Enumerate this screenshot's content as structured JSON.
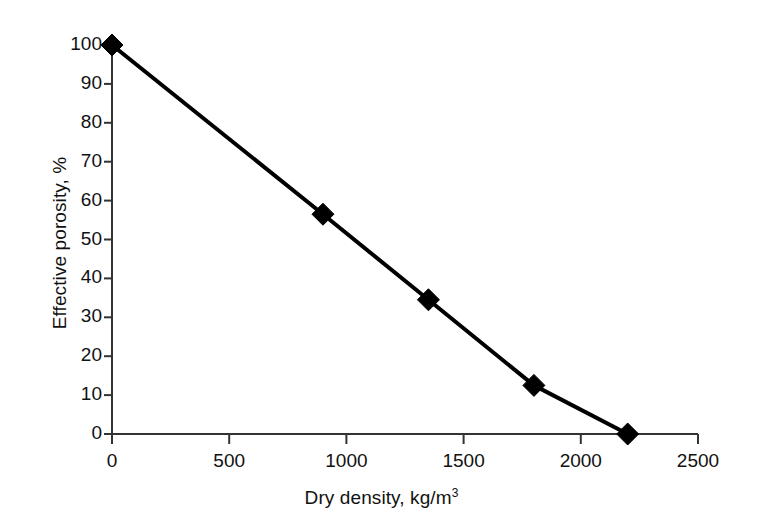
{
  "chart_data": {
    "type": "line",
    "title": "",
    "xlabel": "Dry density, kg/m",
    "xlabel_sup": "3",
    "ylabel": "Effective porosity, %",
    "xlim": [
      0,
      2500
    ],
    "ylim": [
      0,
      100
    ],
    "grid": false,
    "legend": "none",
    "marker": "filled-diamond",
    "line_color": "#000000",
    "marker_color": "#000000",
    "axis_color": "#333333",
    "x_ticks": [
      0,
      500,
      1000,
      1500,
      2000,
      2500
    ],
    "x_tick_labels": [
      "0",
      "500",
      "1000",
      "1500",
      "2000",
      "2500"
    ],
    "y_ticks": [
      0,
      10,
      20,
      30,
      40,
      50,
      60,
      70,
      80,
      90,
      100
    ],
    "y_tick_labels": [
      "0",
      "10",
      "20",
      "30",
      "40",
      "50",
      "60",
      "70",
      "80",
      "90",
      "100"
    ],
    "series": [
      {
        "name": "Effective porosity vs dry density",
        "x": [
          0,
          900,
          1350,
          1800,
          2200
        ],
        "y": [
          100,
          56.5,
          34.5,
          12.5,
          0
        ]
      }
    ]
  }
}
